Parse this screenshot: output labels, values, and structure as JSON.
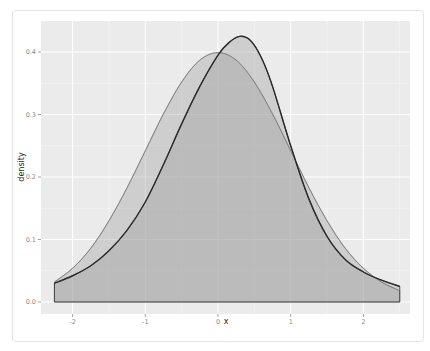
{
  "chart_data": {
    "type": "area",
    "title": "",
    "xlabel": "x",
    "ylabel": "density",
    "xlim": [
      -2.3,
      2.6
    ],
    "ylim": [
      -0.02,
      0.445
    ],
    "x_ticks": [
      -2,
      -1,
      0,
      1,
      2
    ],
    "x_tick_labels": [
      "-2",
      "-1",
      "0",
      "1",
      "2"
    ],
    "y_ticks": [
      0.0,
      0.1,
      0.2,
      0.3,
      0.4
    ],
    "y_tick_labels": [
      "0.0",
      "0.1",
      "0.2",
      "0.3",
      "0.4"
    ],
    "grid": true,
    "legend": "none",
    "series": [
      {
        "name": "density (kernel estimate)",
        "style": "dark outline, grey fill",
        "x": [
          -2.25,
          -2.0,
          -1.75,
          -1.5,
          -1.25,
          -1.0,
          -0.75,
          -0.5,
          -0.25,
          0.0,
          0.15,
          0.3,
          0.45,
          0.6,
          0.75,
          1.0,
          1.25,
          1.5,
          1.75,
          2.0,
          2.25,
          2.5
        ],
        "values": [
          0.03,
          0.042,
          0.058,
          0.082,
          0.115,
          0.16,
          0.22,
          0.285,
          0.345,
          0.395,
          0.415,
          0.425,
          0.418,
          0.39,
          0.345,
          0.25,
          0.165,
          0.105,
          0.068,
          0.048,
          0.035,
          0.025
        ]
      },
      {
        "name": "normal density",
        "style": "light outline, grey fill",
        "x": [
          -2.25,
          -2.0,
          -1.75,
          -1.5,
          -1.25,
          -1.0,
          -0.75,
          -0.5,
          -0.25,
          0.0,
          0.25,
          0.5,
          0.75,
          1.0,
          1.25,
          1.5,
          1.75,
          2.0,
          2.25,
          2.5
        ],
        "values": [
          0.032,
          0.054,
          0.086,
          0.13,
          0.183,
          0.242,
          0.301,
          0.352,
          0.387,
          0.399,
          0.387,
          0.352,
          0.301,
          0.242,
          0.183,
          0.13,
          0.086,
          0.054,
          0.032,
          0.018
        ]
      }
    ]
  },
  "colors": {
    "panel_bg": "#ebebeb",
    "grid": "#ffffff",
    "fill": "#999999",
    "density_line": "#2b2b2b",
    "normal_line": "#7a7a7a"
  }
}
